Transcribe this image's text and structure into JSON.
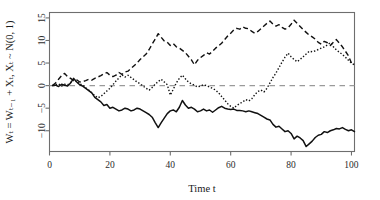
{
  "chart_data": {
    "type": "line",
    "title": "",
    "xlabel": "Time t",
    "ylabel": "Wₜ = Wₜ₋₁ + Xₜ, Xₜ ~ N(0, 1)",
    "xlim": [
      0,
      101
    ],
    "ylim": [
      -14.6,
      16.2
    ],
    "xticks": [
      0,
      20,
      40,
      60,
      80,
      100
    ],
    "xtick_labels": [
      "0",
      "20",
      "40",
      "60",
      "80",
      "100"
    ],
    "yticks": [
      -10,
      -5,
      0,
      5,
      10,
      15
    ],
    "ytick_labels": [
      "−10",
      "−5",
      "0",
      "5",
      "10",
      "15"
    ],
    "grid": false,
    "legend": "none",
    "annotations": [
      {
        "name": "zero-reference-line",
        "type": "hline",
        "y": 0,
        "style": "dashed",
        "color": "#9a9a9a"
      }
    ],
    "x": [
      1,
      2,
      3,
      4,
      5,
      6,
      7,
      8,
      9,
      10,
      11,
      12,
      13,
      14,
      15,
      16,
      17,
      18,
      19,
      20,
      21,
      22,
      23,
      24,
      25,
      26,
      27,
      28,
      29,
      30,
      31,
      32,
      33,
      34,
      35,
      36,
      37,
      38,
      39,
      40,
      41,
      42,
      43,
      44,
      45,
      46,
      47,
      48,
      49,
      50,
      51,
      52,
      53,
      54,
      55,
      56,
      57,
      58,
      59,
      60,
      61,
      62,
      63,
      64,
      65,
      66,
      67,
      68,
      69,
      70,
      71,
      72,
      73,
      74,
      75,
      76,
      77,
      78,
      79,
      80,
      81,
      82,
      83,
      84,
      85,
      86,
      87,
      88,
      89,
      90,
      91,
      92,
      93,
      94,
      95,
      96,
      97,
      98,
      99,
      100,
      101
    ],
    "series": [
      {
        "name": "walk-solid",
        "style": "solid",
        "color": "#111111",
        "values": [
          0,
          0.1,
          -0.2,
          0.3,
          0.1,
          -0.1,
          0.6,
          1.6,
          0.8,
          0.2,
          -0.1,
          -0.6,
          -1.1,
          -1.6,
          -2.6,
          -3.1,
          -3.6,
          -4.4,
          -4.2,
          -5.0,
          -4.8,
          -5.2,
          -5.6,
          -5.4,
          -5.0,
          -5.2,
          -5.6,
          -5.4,
          -5.0,
          -5.2,
          -5.6,
          -6.0,
          -6.4,
          -7.0,
          -8.2,
          -9.3,
          -8.2,
          -7.2,
          -6.2,
          -5.6,
          -5.4,
          -5.8,
          -4.8,
          -3.3,
          -4.3,
          -5.0,
          -4.8,
          -5.2,
          -5.8,
          -5.6,
          -5.2,
          -5.6,
          -5.4,
          -5.9,
          -5.4,
          -4.9,
          -4.6,
          -5.0,
          -5.2,
          -5.3,
          -5.2,
          -5.5,
          -5.5,
          -5.6,
          -5.8,
          -5.6,
          -5.8,
          -6.0,
          -6.2,
          -6.6,
          -7.0,
          -7.4,
          -7.6,
          -8.6,
          -9.2,
          -9.0,
          -9.6,
          -10.2,
          -10.0,
          -10.6,
          -11.8,
          -11.2,
          -11.6,
          -12.2,
          -13.5,
          -12.9,
          -12.3,
          -11.5,
          -11.0,
          -10.8,
          -10.2,
          -10.4,
          -10.0,
          -9.8,
          -9.5,
          -9.6,
          -9.3,
          -9.7,
          -10.0,
          -9.8,
          -10.2
        ]
      },
      {
        "name": "walk-dashed",
        "style": "dashed",
        "color": "#111111",
        "values": [
          0,
          0.6,
          1.4,
          2.2,
          2.7,
          2.0,
          1.6,
          1.1,
          1.3,
          0.8,
          0.9,
          1.1,
          1.4,
          1.2,
          1.6,
          1.9,
          2.2,
          2.6,
          2.9,
          2.3,
          2.0,
          2.3,
          2.9,
          2.5,
          3.0,
          3.2,
          3.8,
          4.4,
          5.0,
          5.8,
          6.4,
          7.0,
          8.0,
          9.2,
          10.3,
          11.5,
          10.7,
          9.9,
          9.6,
          8.9,
          9.3,
          8.6,
          8.3,
          7.8,
          7.3,
          6.5,
          5.7,
          4.6,
          5.6,
          6.2,
          6.7,
          7.3,
          7.0,
          7.6,
          8.3,
          8.8,
          9.4,
          10.2,
          11.0,
          11.6,
          12.3,
          12.7,
          12.5,
          13.0,
          12.7,
          12.6,
          12.0,
          11.6,
          12.0,
          12.6,
          13.2,
          13.8,
          14.3,
          13.6,
          13.2,
          13.5,
          12.9,
          12.5,
          12.8,
          13.6,
          14.5,
          13.8,
          13.1,
          12.4,
          11.8,
          11.2,
          10.8,
          10.3,
          9.6,
          9.2,
          9.8,
          9.5,
          8.9,
          9.6,
          10.2,
          9.4,
          8.6,
          7.6,
          6.6,
          5.0,
          4.8
        ]
      },
      {
        "name": "walk-dotted",
        "style": "dotted",
        "color": "#111111",
        "values": [
          0,
          0.2,
          0.4,
          -0.1,
          0.3,
          0.2,
          0.7,
          1.4,
          0.9,
          0.4,
          0.1,
          -0.5,
          -1.0,
          -1.6,
          -2.2,
          -2.7,
          -2.4,
          -1.8,
          -1.2,
          -0.6,
          0.2,
          1.0,
          1.7,
          2.4,
          1.9,
          2.3,
          1.8,
          1.3,
          0.8,
          0.4,
          -0.1,
          -0.6,
          -1.0,
          -0.4,
          0.3,
          0.9,
          1.4,
          0.8,
          0.2,
          -2.1,
          -0.8,
          0.6,
          1.6,
          2.3,
          1.5,
          0.8,
          0.4,
          0.1,
          -0.3,
          -0.1,
          0.2,
          0.0,
          -0.3,
          -0.6,
          -1.0,
          -1.6,
          -2.4,
          -3.2,
          -4.0,
          -4.6,
          -5.0,
          -4.4,
          -4.0,
          -3.6,
          -3.1,
          -3.4,
          -2.9,
          -2.0,
          -1.3,
          -1.0,
          -1.4,
          -0.6,
          0.6,
          1.8,
          2.8,
          4.0,
          5.2,
          6.3,
          7.2,
          6.4,
          5.8,
          5.3,
          5.8,
          6.4,
          7.0,
          7.6,
          7.5,
          7.7,
          8.0,
          8.3,
          8.6,
          9.0,
          9.5,
          8.6,
          7.9,
          7.4,
          6.9,
          6.3,
          5.6,
          5.0,
          4.6
        ]
      }
    ]
  },
  "axes": {
    "x_title": "Time t",
    "y_title": "Wₜ = Wₜ₋₁ + Xₜ, Xₜ ~ N(0, 1)"
  }
}
